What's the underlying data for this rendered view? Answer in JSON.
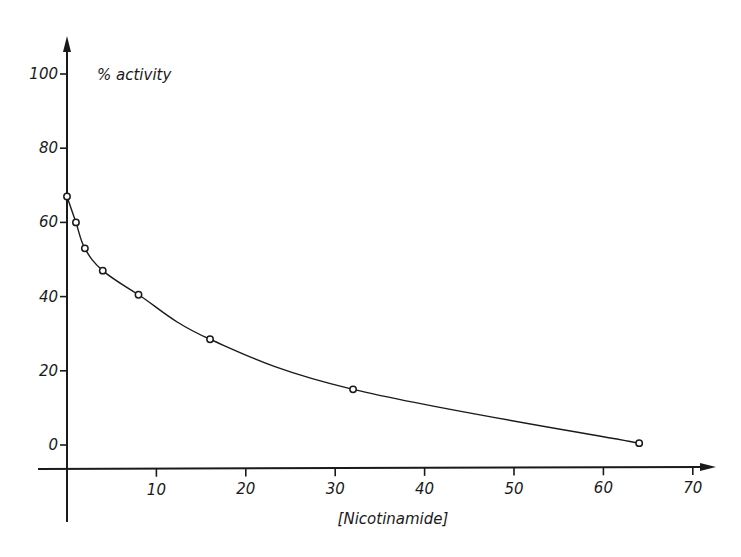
{
  "chart_data": {
    "type": "line",
    "title": "",
    "xlabel": "[Nicotinamide]",
    "ylabel": "% activity",
    "x": [
      0,
      1,
      2,
      4,
      8,
      16,
      32,
      64
    ],
    "series": [
      {
        "name": "% activity",
        "values": [
          67,
          60,
          53,
          47,
          40.5,
          28.5,
          15,
          0.5
        ],
        "marker": "open-circle",
        "line": "smooth"
      }
    ],
    "xlim": [
      0,
      70
    ],
    "ylim": [
      0,
      100
    ],
    "xticks": [
      10,
      20,
      30,
      40,
      50,
      60,
      70
    ],
    "yticks": [
      0,
      20,
      40,
      60,
      80,
      100
    ],
    "grid": false,
    "legend": null
  },
  "colors": {
    "ink": "#1a1a1a",
    "background": "#ffffff"
  }
}
